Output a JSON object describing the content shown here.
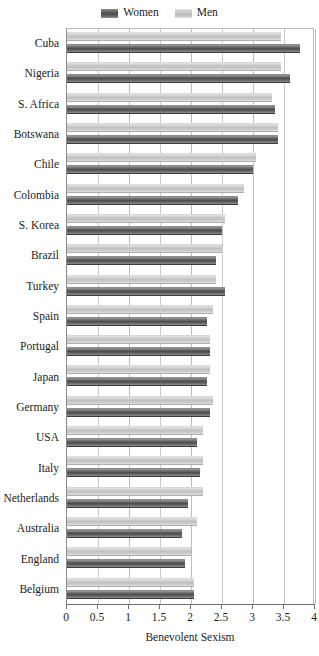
{
  "legend": {
    "entries": [
      {
        "label": "Women",
        "key": "women",
        "color": "#4e4e4e"
      },
      {
        "label": "Men",
        "key": "men",
        "color": "#c0c0c0"
      }
    ]
  },
  "axis": {
    "x_title": "Benevolent Sexism",
    "x_ticks": [
      "0",
      "0.5",
      "1",
      "1.5",
      "2",
      "2.5",
      "3",
      "3.5",
      "4"
    ]
  },
  "chart_data": {
    "type": "bar",
    "orientation": "horizontal",
    "title": "",
    "subtitle": "",
    "xlabel": "Benevolent Sexism",
    "ylabel": "",
    "xlim": [
      0,
      4
    ],
    "xticks": [
      0,
      0.5,
      1,
      1.5,
      2,
      2.5,
      3,
      3.5,
      4
    ],
    "grid": true,
    "grid_axis": "x",
    "legend_position": "top-center",
    "categories": [
      "Cuba",
      "Nigeria",
      "S. Africa",
      "Botswana",
      "Chile",
      "Colombia",
      "S. Korea",
      "Brazil",
      "Turkey",
      "Spain",
      "Portugal",
      "Japan",
      "Germany",
      "USA",
      "Italy",
      "Netherlands",
      "Australia",
      "England",
      "Belgium"
    ],
    "series": [
      {
        "name": "Women",
        "color": "#4e4e4e",
        "values": [
          3.75,
          3.6,
          3.35,
          3.4,
          3.0,
          2.75,
          2.5,
          2.4,
          2.55,
          2.25,
          2.3,
          2.25,
          2.3,
          2.1,
          2.15,
          1.95,
          1.85,
          1.9,
          2.05
        ]
      },
      {
        "name": "Men",
        "color": "#c0c0c0",
        "values": [
          3.45,
          3.45,
          3.3,
          3.4,
          3.05,
          2.85,
          2.55,
          2.5,
          2.4,
          2.35,
          2.3,
          2.3,
          2.35,
          2.2,
          2.2,
          2.2,
          2.1,
          2.0,
          2.05
        ]
      }
    ]
  }
}
